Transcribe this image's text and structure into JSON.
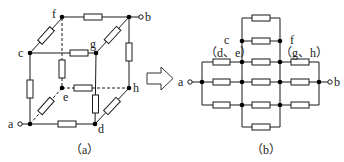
{
  "figure_a": {
    "caption": "（a）",
    "description": "Cube of 12 identical resistors",
    "nodes": {
      "a": "a",
      "b": "b",
      "c": "c",
      "d": "d",
      "e": "e",
      "f": "f",
      "g": "g",
      "h": "h"
    }
  },
  "figure_b": {
    "caption": "（b）",
    "description": "Equivalent circuit of the resistor cube between a and b",
    "labels": {
      "a": "a",
      "b": "b",
      "c": "c",
      "de": "（d、e）",
      "f": "f",
      "gh": "（g、h）"
    }
  },
  "arrow": {
    "icon": "hollow-right-arrow"
  },
  "colors": {
    "line": "#1a1a1a",
    "background": "#ffffff"
  }
}
